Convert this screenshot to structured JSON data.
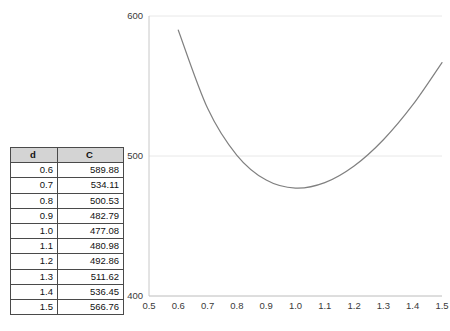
{
  "table": {
    "name": "cost-table",
    "headers": [
      "d",
      "C"
    ],
    "rows": [
      [
        "0.6",
        "589.88"
      ],
      [
        "0.7",
        "534.11"
      ],
      [
        "0.8",
        "500.53"
      ],
      [
        "0.9",
        "482.79"
      ],
      [
        "1.0",
        "477.08"
      ],
      [
        "1.1",
        "480.98"
      ],
      [
        "1.2",
        "492.86"
      ],
      [
        "1.3",
        "511.62"
      ],
      [
        "1.4",
        "536.45"
      ],
      [
        "1.5",
        "566.76"
      ]
    ]
  },
  "chart_data": {
    "type": "line",
    "title": "",
    "xlabel": "",
    "ylabel": "",
    "x": [
      0.6,
      0.7,
      0.8,
      0.9,
      1.0,
      1.1,
      1.2,
      1.3,
      1.4,
      1.5
    ],
    "values": [
      589.88,
      534.11,
      500.53,
      482.79,
      477.08,
      480.98,
      492.86,
      511.62,
      536.45,
      566.76
    ],
    "series": [
      {
        "name": "C",
        "values": [
          589.88,
          534.11,
          500.53,
          482.79,
          477.08,
          480.98,
          492.86,
          511.62,
          536.45,
          566.76
        ]
      }
    ],
    "xlim": [
      0.5,
      1.5
    ],
    "ylim": [
      400,
      600
    ],
    "xticks": [
      "0.5",
      "0.6",
      "0.7",
      "0.8",
      "0.9",
      "1.0",
      "1.1",
      "1.2",
      "1.3",
      "1.4",
      "1.5"
    ],
    "xtick_values": [
      0.5,
      0.6,
      0.7,
      0.8,
      0.9,
      1.0,
      1.1,
      1.2,
      1.3,
      1.4,
      1.5
    ],
    "yticks": [
      "600",
      "500",
      "400"
    ],
    "ytick_values": [
      600,
      500,
      400
    ],
    "grid": true,
    "legend": false,
    "line_color": "#808080",
    "axis_color": "#c8c8c8",
    "grid_color": "#e8e8e8"
  }
}
